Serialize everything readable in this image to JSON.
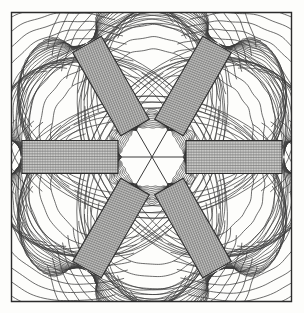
{
  "figure": {
    "title": "Magnetic flux line plot of a six-pole (hexapole) magnet array",
    "type": "field-line-contour-plot",
    "width": 304,
    "height": 313,
    "background_color": "#fdfdfb",
    "line_color": "#3a3a3a",
    "frame_color": "#2b2b2b"
  },
  "frame": {
    "name": "plot-border",
    "x": 11,
    "y": 12,
    "width": 280,
    "height": 289,
    "stroke_width": 1.4
  },
  "center": {
    "x": 152,
    "y": 157,
    "label": "field-null-point"
  },
  "poles": {
    "count": 6,
    "hatch_color": "#6e6e6e",
    "outline_color": "#2b2b2b",
    "length": 96,
    "width": 33,
    "inner_radius": 34,
    "items": [
      {
        "name": "pole-right",
        "angle_deg": 0,
        "hatch": "horizontal"
      },
      {
        "name": "pole-upper-right",
        "angle_deg": -60,
        "hatch": "cross"
      },
      {
        "name": "pole-upper-left",
        "angle_deg": -120,
        "hatch": "cross"
      },
      {
        "name": "pole-left",
        "angle_deg": 180,
        "hatch": "horizontal"
      },
      {
        "name": "pole-lower-left",
        "angle_deg": 120,
        "hatch": "cross"
      },
      {
        "name": "pole-lower-right",
        "angle_deg": 60,
        "hatch": "cross"
      }
    ]
  },
  "separatrices": {
    "name": "separatrix-lines",
    "count": 6,
    "angles_deg": [
      0,
      60,
      120,
      180,
      240,
      300
    ],
    "length": 62,
    "stroke_width": 1.0
  },
  "chart_data": {
    "type": "line",
    "title": "Magnetic flux line plot of a six-pole (hexapole) magnet array",
    "xlabel": "",
    "ylabel": "",
    "xlim": [
      11,
      291
    ],
    "ylim": [
      12,
      301
    ],
    "grid": false,
    "legend": "none",
    "annotations": [
      "six hatched rectangular pole pieces at 60 degree spacing",
      "central field null with six radiating separatrices",
      "closed flux loops linking adjacent pole tips",
      "outer return-flux arcs extending to plot boundary"
    ],
    "series": [
      {
        "name": "tip-flux-arcs",
        "count": 66,
        "description": "dense concentric arcs bridging adjacent pole tips near centre"
      },
      {
        "name": "outer-return-flux",
        "count": 96,
        "description": "long arcs from pole outer ends sweeping to frame edge"
      },
      {
        "name": "separatrix",
        "count": 6,
        "description": "straight null lines through centre"
      }
    ]
  }
}
